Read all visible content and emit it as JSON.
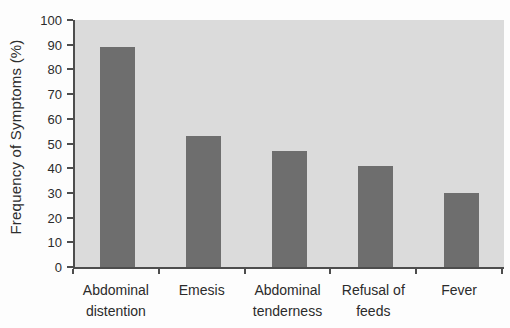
{
  "chart_data": {
    "type": "bar",
    "title": "",
    "xlabel": "",
    "ylabel": "Frequency of Symptoms (%)",
    "categories": [
      "Abdominal distention",
      "Emesis",
      "Abdominal tenderness",
      "Refusal of feeds",
      "Fever"
    ],
    "values": [
      89,
      53,
      47,
      41,
      30
    ],
    "ylim": [
      0,
      100
    ],
    "ytick_step": 10,
    "yticks": [
      0,
      10,
      20,
      30,
      40,
      50,
      60,
      70,
      80,
      90,
      100
    ],
    "grid": "off",
    "legend": "none",
    "colors": {
      "bar": "#6e6e6e",
      "plot_background": "#dbdbdb",
      "axis": "#4d4d4d",
      "text": "#2b2b2b",
      "page_background": "#fdfdfd"
    }
  }
}
